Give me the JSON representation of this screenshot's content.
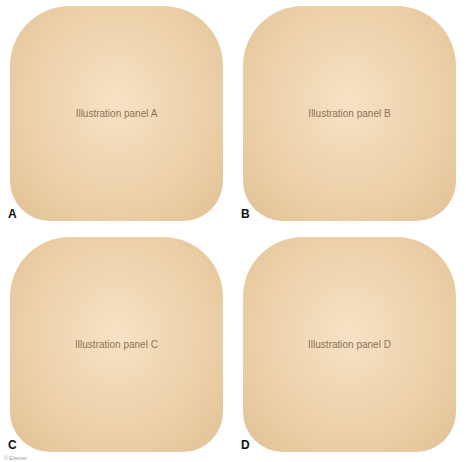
{
  "figure": {
    "type": "four-panel anatomical illustration",
    "panels": [
      {
        "label": "A",
        "placeholder": "Illustration panel A"
      },
      {
        "label": "B",
        "placeholder": "Illustration panel B"
      },
      {
        "label": "C",
        "placeholder": "Illustration panel C"
      },
      {
        "label": "D",
        "placeholder": "Illustration panel D"
      }
    ],
    "caption_fragment": "© Elsevier"
  },
  "colors": {
    "skin_tone": "#ecd0a8",
    "background": "#ffffff",
    "label": "#111111"
  }
}
